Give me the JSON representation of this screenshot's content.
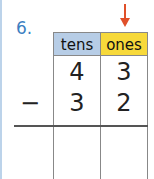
{
  "question": {
    "number": "6."
  },
  "table": {
    "headers": {
      "tens": "tens",
      "ones": "ones"
    },
    "colors": {
      "tens_bg": "#b7cde6",
      "ones_bg": "#f7d93a",
      "arrow": "#e0502a",
      "qnum": "#3d7fc1"
    },
    "rows": [
      {
        "operator": "",
        "tens": "4",
        "ones": "3"
      },
      {
        "operator": "−",
        "tens": "3",
        "ones": "2"
      }
    ],
    "answer": {
      "tens": "",
      "ones": ""
    },
    "arrow_points_to": "ones"
  }
}
